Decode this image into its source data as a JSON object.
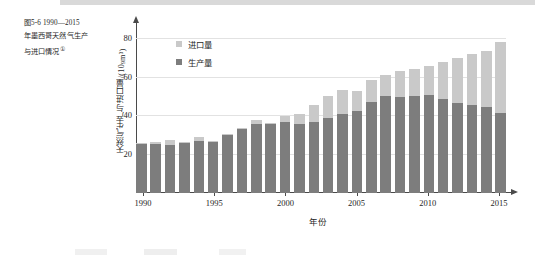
{
  "figure": {
    "caption_line1": "图5-6  1990—2015",
    "caption_line2": "年墨西哥天然气生产",
    "caption_line3": "与进口情况",
    "caption_marker": "①"
  },
  "legend": {
    "import_label": "进口量",
    "production_label": "生产量",
    "import_color": "#c9c9c9",
    "production_color": "#7d7d7d"
  },
  "axes": {
    "y_title_main": "天然气生产与进口量/(10",
    "y_title_sup": "9",
    "y_title_tail": "m³)",
    "x_title": "年份",
    "y_ticks": [
      "20",
      "40",
      "60",
      "80"
    ],
    "x_ticks": [
      "1990",
      "1995",
      "2000",
      "2005",
      "2010",
      "2015"
    ]
  },
  "chart_data": {
    "type": "bar",
    "xlabel": "年份",
    "ylabel": "天然气生产与进口量/(10⁹m³)",
    "ylim": [
      0,
      85
    ],
    "yticks": [
      20,
      40,
      60,
      80
    ],
    "grid": true,
    "stacked": true,
    "legend_position": "top-left inside plot",
    "categories": [
      1990,
      1991,
      1992,
      1993,
      1994,
      1995,
      1996,
      1997,
      1998,
      1999,
      2000,
      2001,
      2002,
      2003,
      2004,
      2005,
      2006,
      2007,
      2008,
      2009,
      2010,
      2011,
      2012,
      2013,
      2014,
      2015
    ],
    "series": [
      {
        "name": "生产量",
        "color": "#7d7d7d",
        "values": [
          25.4,
          25.2,
          24.6,
          25.6,
          26.6,
          26.2,
          29.7,
          32.8,
          35.3,
          35.7,
          36.5,
          35.8,
          36.6,
          38.9,
          40.6,
          42.2,
          47.0,
          50.0,
          49.5,
          49.8,
          50.4,
          48.2,
          46.3,
          45.3,
          44.3,
          41.3
        ]
      },
      {
        "name": "进口量",
        "color": "#c9c9c9",
        "values": [
          0.4,
          1.3,
          2.5,
          0.5,
          2.2,
          0.6,
          0.7,
          0.9,
          2.2,
          0.6,
          3.4,
          4.8,
          8.6,
          11.1,
          12.6,
          10.5,
          11.2,
          10.8,
          13.2,
          13.9,
          14.9,
          19.2,
          23.5,
          26.5,
          28.9,
          36.5
        ]
      },
      {
        "name": "总量",
        "color": "#000000",
        "values": [
          25.8,
          26.5,
          27.1,
          26.1,
          28.8,
          26.8,
          30.4,
          33.7,
          37.5,
          36.3,
          39.9,
          40.6,
          45.2,
          50.0,
          53.2,
          52.7,
          58.2,
          60.8,
          62.7,
          63.7,
          65.3,
          67.4,
          69.8,
          71.8,
          73.2,
          77.8
        ]
      }
    ]
  }
}
